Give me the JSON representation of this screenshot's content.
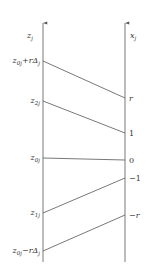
{
  "diagram": {
    "left_axis": {
      "label": "z",
      "sub": "j",
      "x": 43
    },
    "right_axis": {
      "label": "x",
      "sub": "j",
      "x": 125
    },
    "axis_top": 22,
    "axis_bottom": 262,
    "colors": {
      "line": "#555555",
      "text": "#333333"
    },
    "mappings": [
      {
        "left_main": "z",
        "left_sub": "0j",
        "left_suffix": "+rΔ",
        "left_suffix_sub": "j",
        "right_label": "r",
        "right_italic": true,
        "y_left": 61,
        "y_right": 98
      },
      {
        "left_main": "z",
        "left_sub": "2j",
        "left_suffix": "",
        "left_suffix_sub": "",
        "right_label": "1",
        "right_italic": false,
        "y_left": 101,
        "y_right": 133
      },
      {
        "left_main": "z",
        "left_sub": "0j",
        "left_suffix": "",
        "left_suffix_sub": "",
        "right_label": "0",
        "right_italic": false,
        "y_left": 158,
        "y_right": 160
      },
      {
        "left_main": "z",
        "left_sub": "1j",
        "left_suffix": "",
        "left_suffix_sub": "",
        "right_label": "−1",
        "right_italic": false,
        "y_left": 213,
        "y_right": 178
      },
      {
        "left_main": "z",
        "left_sub": "0j",
        "left_suffix": "−rΔ",
        "left_suffix_sub": "j",
        "right_label": "−r",
        "right_italic": true,
        "y_left": 251,
        "y_right": 215
      }
    ]
  }
}
